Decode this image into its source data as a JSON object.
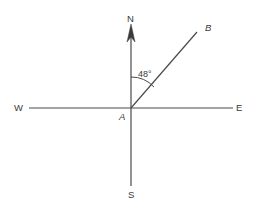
{
  "figure": {
    "type": "geometry-compass-diagram",
    "background_color": "#ffffff",
    "line_color": "#4a4a4a",
    "text_color": "#3a3a3a",
    "labels": {
      "north": "N",
      "south": "S",
      "west": "W",
      "east": "E",
      "vertex": "A",
      "ray_end": "B",
      "angle": "48°"
    },
    "angle_value": 48,
    "angle_unit": "degrees",
    "vertex_point": {
      "x": 131,
      "y": 108
    },
    "ray_end_point": {
      "x": 197,
      "y": 32
    },
    "axes": {
      "vertical": {
        "x": 131,
        "y_top": 26,
        "y_bottom": 186
      },
      "horizontal": {
        "y": 108,
        "x_left": 29,
        "x_right": 233
      }
    },
    "arc": {
      "radius": 31,
      "from": "north-axis",
      "to": "ray-AB"
    },
    "arrow": {
      "direction": "up",
      "at": "north-axis-top"
    }
  }
}
